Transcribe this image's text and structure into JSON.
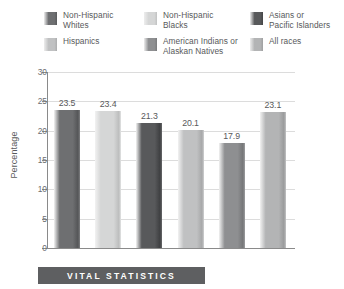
{
  "legend": {
    "items": [
      {
        "label": "Non-Hispanic\nWhites",
        "color": "#6e6f71",
        "swatch_name": "legend-swatch-non-hispanic-whites"
      },
      {
        "label": "Non-Hispanic\nBlacks",
        "color": "#d5d6d6",
        "swatch_name": "legend-swatch-non-hispanic-blacks"
      },
      {
        "label": "Asians or\nPacific Islanders",
        "color": "#58595b",
        "swatch_name": "legend-swatch-asians-or-pacific-islanders"
      },
      {
        "label": "Hispanics",
        "color": "#c0c1c2",
        "swatch_name": "legend-swatch-hispanics"
      },
      {
        "label": "American Indians or\nAlaskan Natives",
        "color": "#8e8f91",
        "swatch_name": "legend-swatch-american-indians-or-alaskan-natives"
      },
      {
        "label": "All races",
        "color": "#b3b4b5",
        "swatch_name": "legend-swatch-all-races"
      }
    ]
  },
  "banner": {
    "text": "VITAL STATISTICS",
    "background": "#5e5f61",
    "text_color": "#ffffff"
  },
  "chart_data": {
    "type": "bar",
    "title": "",
    "xlabel": "",
    "ylabel": "Percentage",
    "ylim": [
      0,
      30
    ],
    "yticks": [
      0,
      5,
      10,
      15,
      20,
      25,
      30
    ],
    "ytick_labels": [
      "0",
      "5",
      "10",
      "15",
      "20",
      "25",
      "30"
    ],
    "grid": true,
    "legend_position": "top",
    "categories": [
      "Non-Hispanic Whites",
      "Non-Hispanic Blacks",
      "Asians or Pacific Islanders",
      "Hispanics",
      "American Indians or Alaskan Natives",
      "All races"
    ],
    "values": [
      23.5,
      23.4,
      21.3,
      20.1,
      17.9,
      23.1
    ],
    "value_labels": [
      "23.5",
      "23.4",
      "21.3",
      "20.1",
      "17.9",
      "23.1"
    ],
    "colors": [
      "#6e6f71",
      "#d5d6d6",
      "#58595b",
      "#c0c1c2",
      "#8e8f91",
      "#b3b4b5"
    ]
  }
}
